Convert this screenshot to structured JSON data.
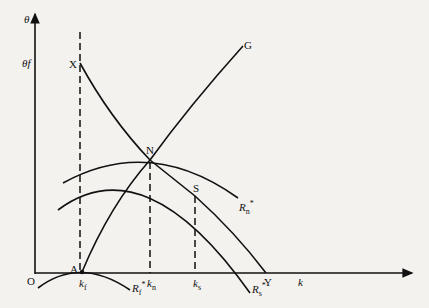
{
  "diagram": {
    "type": "economics-growth-diagram",
    "axes": {
      "y_label": "θ",
      "x_label": "k",
      "origin_label": "O",
      "y_tick_label": "θf"
    },
    "points": {
      "X": "X",
      "N": "N",
      "S": "S",
      "G": "G",
      "A": "A",
      "Y": "Y"
    },
    "x_ticks": {
      "kf": {
        "base": "k",
        "sub": "f"
      },
      "kn": {
        "base": "k",
        "sub": "n"
      },
      "ks": {
        "base": "k",
        "sub": "s"
      }
    },
    "curves": {
      "Rn": {
        "base": "R",
        "sub": "n",
        "sup": "*"
      },
      "Rs": {
        "base": "R",
        "sub": "s",
        "sup": "*"
      },
      "Rf": {
        "base": "R",
        "sub": "f",
        "sup": "*"
      }
    },
    "colors": {
      "ink": "#111111",
      "paper": "#f3f2ef"
    }
  }
}
